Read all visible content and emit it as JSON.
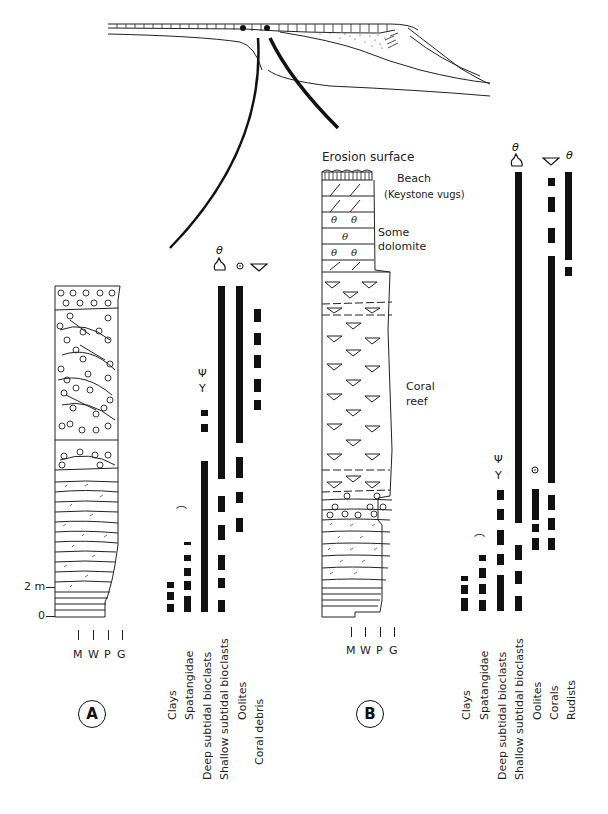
{
  "cross_section": {
    "description": "Platform margin cross-section with two section locations marked"
  },
  "section_a": {
    "label": "A",
    "scale": {
      "top": "2 m",
      "bottom": "0"
    },
    "texture_axis": [
      "M",
      "W",
      "P",
      "G"
    ],
    "columns": [
      {
        "name": "Clays",
        "x": 170,
        "segments": [
          [
            582,
            588
          ],
          [
            592,
            600
          ],
          [
            604,
            612
          ]
        ]
      },
      {
        "name": "Spatangidae",
        "x": 187,
        "segments": [
          [
            542,
            545
          ],
          [
            555,
            561
          ],
          [
            568,
            576
          ],
          [
            581,
            590
          ],
          [
            596,
            612
          ]
        ]
      },
      {
        "name": "Deep subtidal bioclasts",
        "x": 204,
        "segments": [
          [
            410,
            416
          ],
          [
            424,
            432
          ],
          [
            461,
            612
          ]
        ]
      },
      {
        "name": "Shallow subtidal bioclasts",
        "x": 221,
        "segments": [
          [
            286,
            479
          ],
          [
            496,
            512
          ],
          [
            525,
            540
          ],
          [
            555,
            570
          ],
          [
            578,
            588
          ],
          [
            600,
            612
          ]
        ]
      },
      {
        "name": "Oolites",
        "x": 239,
        "segments": [
          [
            286,
            443
          ],
          [
            457,
            478
          ],
          [
            492,
            503
          ],
          [
            518,
            532
          ]
        ]
      },
      {
        "name": "Coral debris",
        "x": 257,
        "segments": [
          [
            309,
            322
          ],
          [
            333,
            345
          ],
          [
            355,
            368
          ],
          [
            379,
            392
          ],
          [
            400,
            410
          ]
        ]
      }
    ],
    "labels": [
      "Clays",
      "Spatangidae",
      "Deep subtidal bioclasts",
      "Shallow subtidal bioclasts",
      "Oolites",
      "Coral debris"
    ]
  },
  "section_b": {
    "label": "B",
    "annotations": {
      "erosion": "Erosion surface",
      "beach": "Beach",
      "keystone": "(Keystone vugs)",
      "dolomite_1": "Some",
      "dolomite_2": "dolomite",
      "coral_1": "Coral",
      "coral_2": "reef"
    },
    "texture_axis": [
      "M",
      "W",
      "P",
      "G"
    ],
    "columns": [
      {
        "name": "Clays",
        "x": 464,
        "segments": [
          [
            576,
            581
          ],
          [
            585,
            594
          ],
          [
            598,
            611
          ]
        ]
      },
      {
        "name": "Spatangidae",
        "x": 482,
        "segments": [
          [
            555,
            561
          ],
          [
            568,
            578
          ],
          [
            584,
            594
          ],
          [
            600,
            611
          ]
        ]
      },
      {
        "name": "Deep subtidal bioclasts",
        "x": 500,
        "segments": [
          [
            490,
            500
          ],
          [
            509,
            520
          ],
          [
            530,
            545
          ],
          [
            554,
            565
          ],
          [
            575,
            611
          ]
        ]
      },
      {
        "name": "Shallow subtidal bioclasts",
        "x": 518,
        "segments": [
          [
            172,
            523
          ],
          [
            545,
            560
          ],
          [
            571,
            584
          ],
          [
            596,
            611
          ]
        ]
      },
      {
        "name": "Oolites",
        "x": 535,
        "segments": [
          [
            489,
            520
          ],
          [
            524,
            532
          ],
          [
            538,
            550
          ]
        ]
      },
      {
        "name": "Corals",
        "x": 551,
        "segments": [
          [
            178,
            186
          ],
          [
            197,
            212
          ],
          [
            228,
            243
          ],
          [
            256,
            483
          ],
          [
            495,
            510
          ],
          [
            518,
            530
          ],
          [
            538,
            550
          ]
        ]
      },
      {
        "name": "Rudists",
        "x": 568,
        "segments": [
          [
            172,
            260
          ],
          [
            267,
            276
          ]
        ]
      }
    ],
    "labels": [
      "Clays",
      "Spatangidae",
      "Deep subtidal bioclasts",
      "Shallow subtidal bioclasts",
      "Oolites",
      "Corals",
      "Rudists"
    ]
  }
}
